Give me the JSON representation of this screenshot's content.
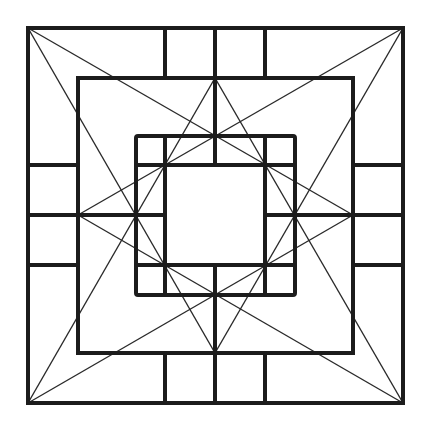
{
  "diagram": {
    "title": "",
    "type": "geometric-square-lattice-pattern",
    "canvas": {
      "width": 429,
      "height": 431,
      "background": "#ffffff"
    },
    "colors": {
      "thick_line": "#1c1c1c",
      "thin_line": "#2a2a2a"
    },
    "outer_square": {
      "x1": 28,
      "y1": 28,
      "x2": 403,
      "y2": 403
    },
    "band_square": {
      "x1": 78,
      "y1": 78,
      "x2": 353,
      "y2": 353
    },
    "inner_box": {
      "x1": 136,
      "y1": 136,
      "x2": 295,
      "y2": 295
    },
    "center_square": {
      "x1": 165,
      "y1": 165,
      "x2": 265,
      "y2": 265
    },
    "apex_points": [
      {
        "name": "top",
        "x": 215,
        "y": 78
      },
      {
        "name": "right",
        "x": 353,
        "y": 215
      },
      {
        "name": "bottom",
        "x": 215,
        "y": 353
      },
      {
        "name": "left",
        "x": 78,
        "y": 215
      }
    ],
    "thick_segments": [
      [
        165,
        28,
        165,
        78
      ],
      [
        215,
        28,
        215,
        78
      ],
      [
        265,
        28,
        265,
        78
      ],
      [
        165,
        353,
        165,
        403
      ],
      [
        215,
        353,
        215,
        403
      ],
      [
        265,
        353,
        265,
        403
      ],
      [
        28,
        165,
        78,
        165
      ],
      [
        28,
        215,
        78,
        215
      ],
      [
        28,
        265,
        78,
        265
      ],
      [
        353,
        165,
        403,
        165
      ],
      [
        353,
        215,
        403,
        215
      ],
      [
        353,
        265,
        403,
        265
      ],
      [
        215,
        78,
        215,
        165
      ],
      [
        215,
        265,
        215,
        353
      ],
      [
        78,
        215,
        165,
        215
      ],
      [
        265,
        215,
        353,
        215
      ],
      [
        136,
        165,
        295,
        165
      ],
      [
        136,
        265,
        295,
        265
      ],
      [
        165,
        136,
        165,
        295
      ],
      [
        265,
        136,
        265,
        295
      ]
    ],
    "diagonals": [
      [
        28,
        28,
        353,
        215
      ],
      [
        28,
        28,
        215,
        353
      ],
      [
        403,
        28,
        78,
        215
      ],
      [
        403,
        28,
        215,
        353
      ],
      [
        28,
        403,
        215,
        78
      ],
      [
        28,
        403,
        353,
        215
      ],
      [
        403,
        403,
        215,
        78
      ],
      [
        403,
        403,
        78,
        215
      ]
    ]
  }
}
